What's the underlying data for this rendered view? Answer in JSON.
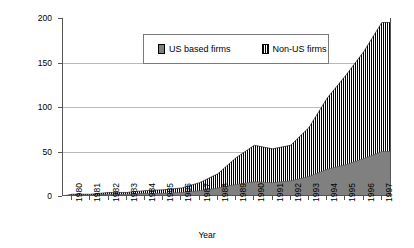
{
  "chart_data": {
    "type": "area",
    "title": "",
    "xlabel": "Year",
    "ylabel": "Patents Filed (Number/Year)",
    "ylim": [
      0,
      200
    ],
    "yticks": [
      0,
      50,
      100,
      150,
      200
    ],
    "xlim": [
      1980,
      1997
    ],
    "grid": true,
    "legend_position": "upper-center",
    "stacked": true,
    "categories": [
      1980,
      1981,
      1982,
      1983,
      1984,
      1985,
      1986,
      1987,
      1988,
      1989,
      1990,
      1991,
      1992,
      1993,
      1994,
      1995,
      1996,
      1997
    ],
    "xticklabels": [
      "1980",
      "1981",
      "1982",
      "1983",
      "1984",
      "1985",
      "1986",
      "1987",
      "1988",
      "1989",
      "1990",
      "1991",
      "1992",
      "1993",
      "1994",
      "1995",
      "1996",
      "1997"
    ],
    "series": [
      {
        "name": "US based firms",
        "fill": "solid-grey",
        "color": "#808080",
        "values": [
          1,
          1,
          2,
          2,
          3,
          3,
          4,
          6,
          9,
          13,
          16,
          15,
          17,
          22,
          30,
          35,
          42,
          50
        ]
      },
      {
        "name": "Non-US firms",
        "fill": "vertical-hatch",
        "color": "#000000",
        "values": [
          1,
          1,
          2,
          2,
          3,
          4,
          5,
          9,
          16,
          30,
          41,
          38,
          40,
          55,
          80,
          100,
          120,
          145
        ]
      }
    ],
    "totals": [
      2,
      2,
      4,
      4,
      6,
      7,
      9,
      15,
      25,
      43,
      57,
      53,
      57,
      77,
      110,
      135,
      162,
      195
    ]
  },
  "legend": {
    "items": [
      {
        "label": "US based firms",
        "swatch": "solid-grey-swatch"
      },
      {
        "label": "Non-US firms",
        "swatch": "vertical-hatch-swatch"
      }
    ]
  },
  "axes": {
    "y_title": "Patents Filed (Number/Year)",
    "x_title": "Year",
    "y_ticks": [
      "0",
      "50",
      "100",
      "150",
      "200"
    ],
    "x_ticks": [
      "1980",
      "1981",
      "1982",
      "1983",
      "1984",
      "1985",
      "1986",
      "1987",
      "1988",
      "1989",
      "1990",
      "1991",
      "1992",
      "1993",
      "1994",
      "1995",
      "1996",
      "1997"
    ]
  },
  "colors": {
    "us_fill": "#808080",
    "nonus_fill": "#000000",
    "axis": "#555555",
    "grid": "#b9b9b9",
    "background": "#ffffff"
  }
}
